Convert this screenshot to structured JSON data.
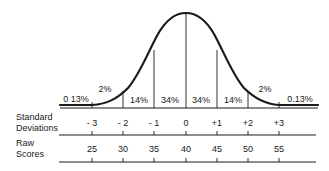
{
  "diagram": {
    "area_labels": [
      {
        "text": "0 13%",
        "x": 76,
        "y": 102
      },
      {
        "text": "2%",
        "x": 105,
        "y": 92
      },
      {
        "text": "14%",
        "x": 139,
        "y": 103
      },
      {
        "text": "34%",
        "x": 170,
        "y": 103
      },
      {
        "text": "34%",
        "x": 201,
        "y": 103
      },
      {
        "text": "14%",
        "x": 233,
        "y": 103
      },
      {
        "text": "2%",
        "x": 265,
        "y": 92
      },
      {
        "text": "0.13%",
        "x": 300,
        "y": 102
      }
    ],
    "rows": {
      "standard_deviations": {
        "label_line1": "Standard",
        "label_line2": "Deviations",
        "values": [
          "- 3",
          "- 2",
          "- 1",
          "0",
          "+1",
          "+2",
          "+3"
        ]
      },
      "raw_scores": {
        "label_line1": "Raw",
        "label_line2": "Scores",
        "values": [
          "25",
          "30",
          "35",
          "40",
          "45",
          "50",
          "55"
        ]
      }
    },
    "tick_x": [
      92,
      123,
      154,
      186,
      217,
      248,
      279
    ],
    "colors": {
      "ink": "#1a1a1a",
      "background": "#ffffff"
    }
  }
}
